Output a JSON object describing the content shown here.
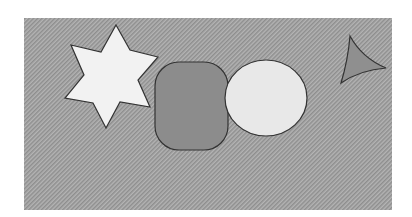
{
  "canvas": {
    "width": 412,
    "height": 217,
    "background": "#ffffff",
    "panel": {
      "x": 24,
      "y": 18,
      "width": 368,
      "height": 192,
      "fill": "#a9a9a9"
    }
  },
  "shapes": [
    {
      "type": "star",
      "name": "six-point-star",
      "fill": "#f2f2f2",
      "stroke": "#333333",
      "points": "116,25 130,50 158,57 138,80 150,107 120,102 106,128 93,103 65,98 84,75 71,45 101,52"
    },
    {
      "type": "rounded-rect",
      "name": "rounded-rectangle",
      "fill": "#8c8c8c",
      "stroke": "#333333",
      "x": 155,
      "y": 62,
      "width": 73,
      "height": 88,
      "rx": 24
    },
    {
      "type": "ellipse",
      "name": "ellipse",
      "fill": "#e8e8e8",
      "stroke": "#333333",
      "cx": 266,
      "cy": 98,
      "rx": 41,
      "ry": 38
    },
    {
      "type": "curved-triangle",
      "name": "curved-triangle",
      "fill": "#8f8f8f",
      "stroke": "#333333",
      "path": "M350,36 Q362,58 386,68 Q360,70 341,83 Q348,60 350,36 Z"
    }
  ]
}
